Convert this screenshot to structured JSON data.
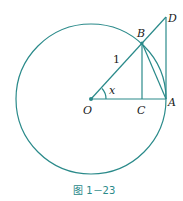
{
  "figure": {
    "caption": "图 1－23",
    "labels": {
      "O": "O",
      "A": "A",
      "B": "B",
      "C": "C",
      "D": "D",
      "radius": "1",
      "angle": "x"
    },
    "colors": {
      "line": "#2a8a8a",
      "text": "#1a1a1a"
    }
  }
}
